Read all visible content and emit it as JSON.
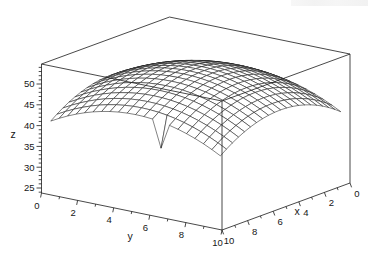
{
  "chart_data": {
    "type": "surface",
    "title": "",
    "xlabel": "x",
    "ylabel": "y",
    "zlabel": "z",
    "x_range": [
      0,
      10
    ],
    "y_range": [
      0,
      10
    ],
    "z_box_range": [
      23.8,
      54.8
    ],
    "x_ticks_major": [
      0,
      2,
      4,
      6,
      8,
      10
    ],
    "x_ticks_minor": [
      1,
      3,
      5,
      7,
      9
    ],
    "y_ticks_major": [
      0,
      2,
      4,
      6,
      8,
      10
    ],
    "y_ticks_minor": [
      1,
      3,
      5,
      7,
      9
    ],
    "z_ticks_major": [
      25,
      30,
      35,
      40,
      45,
      50
    ],
    "z_minor_from": 24,
    "z_minor_to": 54,
    "x_axis_reversed_on_screen": true,
    "grid": "none",
    "legend": "none",
    "surface": {
      "grid_n": 21,
      "grid_min": 0.3,
      "grid_max": 9.7,
      "z_formula": "z = 52.5 - 0.26*((x-5)^2 + (y-5)^2), with one dipped vertex (outlier notch)",
      "z0": 52.5,
      "cx": 5,
      "cy": 5,
      "k": 0.26,
      "peak": {
        "x": 5,
        "y": 5,
        "z": 52.5
      },
      "corner_z": 40.6,
      "dip": {
        "x": 9.7,
        "y": 6.4,
        "dz": -6.3,
        "z_at_dip": 39.9
      }
    },
    "view": {
      "origin": [
        41.5,
        193
      ],
      "y_unit_px": [
        18.05,
        3.7
      ],
      "xrev_unit_px": [
        12.8,
        -4.7
      ],
      "z_px_per_unit": 4.16,
      "hidden_line_removal": true
    },
    "style": {
      "line_color": "#1b1b1b",
      "surface_fill": "#ffffff",
      "background": "#ffffff"
    },
    "tick_label_values": {
      "z": [
        "25",
        "30",
        "35",
        "40",
        "45",
        "50"
      ],
      "y": [
        "0",
        "2",
        "4",
        "6",
        "8",
        "10"
      ],
      "x": [
        "0",
        "2",
        "4",
        "6",
        "8",
        "10"
      ]
    }
  }
}
